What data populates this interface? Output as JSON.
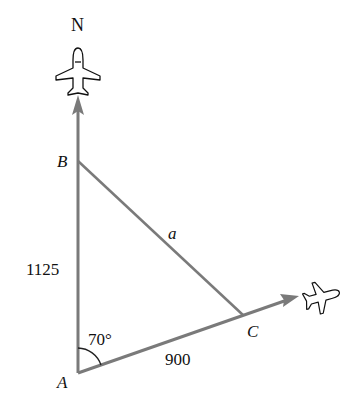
{
  "diagram": {
    "type": "navigation triangle",
    "north_label": "N",
    "vertices": {
      "A": {
        "label": "A",
        "x": 78,
        "y": 373
      },
      "B": {
        "label": "B",
        "x": 78,
        "y": 161
      },
      "C": {
        "label": "C",
        "x": 243,
        "y": 315
      }
    },
    "sides": {
      "AB": {
        "label": "1125"
      },
      "AC": {
        "label": "900"
      },
      "BC": {
        "label": "a"
      }
    },
    "angle_A": {
      "label": "70°"
    },
    "icons": [
      "airplane-north-icon",
      "airplane-east-icon"
    ],
    "colors": {
      "line": "#7a7a7a",
      "text": "#111111"
    }
  }
}
